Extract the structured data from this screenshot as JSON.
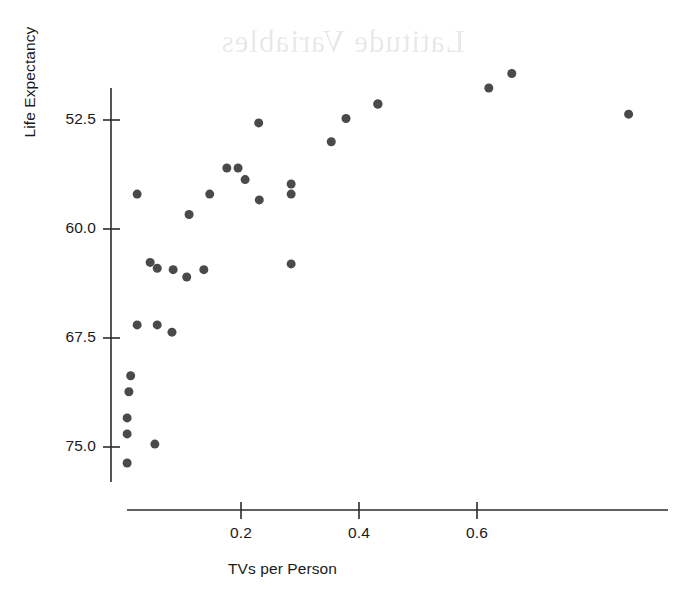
{
  "figure": {
    "background_color": "#ffffff",
    "ink_color": "#4a4a4a",
    "axis_color": "#2b2b2b",
    "bleed_through_text": "Latitude Variables",
    "x_label": "TVs per Person",
    "y_label": "Life Expectancy",
    "y_tick_labels": [
      "75.0",
      "67.5",
      "60.0",
      "52.5"
    ],
    "x_tick_labels": [
      "0.2",
      "0.4",
      "0.6"
    ]
  },
  "chart_data": {
    "type": "scatter",
    "title": "",
    "xlabel": "TVs per Person",
    "ylabel": "Life Expectancy",
    "xlim": [
      -0.02,
      0.8
    ],
    "ylim": [
      50.0,
      79.5
    ],
    "xticks": [
      0.2,
      0.4,
      0.6
    ],
    "yticks": [
      52.5,
      60.0,
      67.5,
      75.0
    ],
    "grid": false,
    "legend": null,
    "marker": "filled-circle",
    "marker_color": "#4a4a4a",
    "marker_size_px": 9,
    "points": [
      {
        "x": 0.007,
        "y": 51.4
      },
      {
        "x": 0.007,
        "y": 53.4
      },
      {
        "x": 0.007,
        "y": 54.5
      },
      {
        "x": 0.01,
        "y": 56.3
      },
      {
        "x": 0.013,
        "y": 57.4
      },
      {
        "x": 0.024,
        "y": 60.9
      },
      {
        "x": 0.024,
        "y": 69.9
      },
      {
        "x": 0.054,
        "y": 52.7
      },
      {
        "x": 0.058,
        "y": 60.9
      },
      {
        "x": 0.046,
        "y": 65.2
      },
      {
        "x": 0.058,
        "y": 64.8
      },
      {
        "x": 0.083,
        "y": 60.4
      },
      {
        "x": 0.085,
        "y": 64.7
      },
      {
        "x": 0.108,
        "y": 64.2
      },
      {
        "x": 0.112,
        "y": 68.5
      },
      {
        "x": 0.137,
        "y": 64.7
      },
      {
        "x": 0.147,
        "y": 69.9
      },
      {
        "x": 0.176,
        "y": 71.7
      },
      {
        "x": 0.195,
        "y": 71.7
      },
      {
        "x": 0.207,
        "y": 70.9
      },
      {
        "x": 0.23,
        "y": 74.8
      },
      {
        "x": 0.231,
        "y": 69.5
      },
      {
        "x": 0.285,
        "y": 69.9
      },
      {
        "x": 0.285,
        "y": 70.6
      },
      {
        "x": 0.285,
        "y": 65.1
      },
      {
        "x": 0.353,
        "y": 73.5
      },
      {
        "x": 0.378,
        "y": 75.1
      },
      {
        "x": 0.432,
        "y": 76.1
      },
      {
        "x": 0.432,
        "y": 76.1
      },
      {
        "x": 0.62,
        "y": 77.2
      },
      {
        "x": 0.659,
        "y": 78.2
      },
      {
        "x": 0.857,
        "y": 75.4
      }
    ]
  }
}
